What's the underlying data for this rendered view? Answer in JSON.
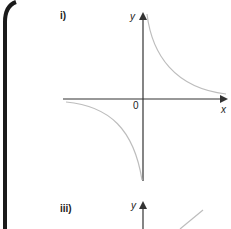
{
  "graphs": [
    {
      "label": "i)",
      "x_axis_label": "x",
      "y_axis_label": "y",
      "origin_label": "0",
      "curve": "hyperbola y = k/x (k > 0), branches in quadrants I and III"
    },
    {
      "label": "iii)",
      "y_axis_label": "y",
      "curve": "straight line with positive gradient (partially visible)"
    }
  ],
  "colors": {
    "axis": "#333333",
    "curve": "#bdbdbd",
    "border": "#1a1a1a"
  }
}
